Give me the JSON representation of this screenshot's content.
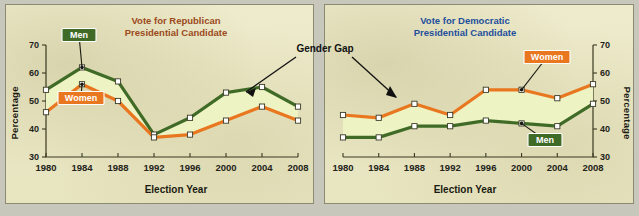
{
  "figure": {
    "background_color": "#c8c7bb",
    "panel_background": "#ece9c8",
    "annotation": {
      "label": "Gender Gap",
      "name": "gender-gap-annotation"
    }
  },
  "colors": {
    "men_line": "#3f6b27",
    "women_line": "#e8771f",
    "band_fill": "#eef3c3",
    "republican_title": "#9c4a1c",
    "democratic_title": "#1d4f9c",
    "marker_fill": "#ffffff"
  },
  "legend": {
    "men_label": "Men",
    "women_label": "Women"
  },
  "chart_data": [
    {
      "id": "republican",
      "type": "line",
      "title": "Vote for Republican\nPresidential Candidate",
      "title_line1": "Vote for Republican",
      "title_line2": "Presidential Candidate",
      "title_color": "#9c4a1c",
      "xlabel": "Election Year",
      "ylabel": "Percentage",
      "ylabel_side": "left",
      "categories": [
        "1980",
        "1984",
        "1988",
        "1992",
        "1996",
        "2000",
        "2004",
        "2008"
      ],
      "x": [
        1980,
        1984,
        1988,
        1992,
        1996,
        2000,
        2004,
        2008
      ],
      "ylim": [
        30,
        70
      ],
      "yticks": [
        30,
        40,
        50,
        60,
        70
      ],
      "grid": false,
      "legend_position": "inside-upper-left",
      "series": [
        {
          "name": "Men",
          "color": "#3f6b27",
          "values": [
            54,
            62,
            57,
            38,
            44,
            53,
            55,
            48
          ]
        },
        {
          "name": "Women",
          "color": "#e8771f",
          "values": [
            46,
            56,
            50,
            37,
            38,
            43,
            48,
            43
          ]
        }
      ]
    },
    {
      "id": "democratic",
      "type": "line",
      "title": "Vote for Democratic\nPresidential Candidate",
      "title_line1": "Vote for Democratic",
      "title_line2": "Presidential Candidate",
      "title_color": "#1d4f9c",
      "xlabel": "Election Year",
      "ylabel": "Percentage",
      "ylabel_side": "right",
      "categories": [
        "1980",
        "1984",
        "1988",
        "1992",
        "1996",
        "2000",
        "2004",
        "2008"
      ],
      "x": [
        1980,
        1984,
        1988,
        1992,
        1996,
        2000,
        2004,
        2008
      ],
      "ylim": [
        30,
        70
      ],
      "yticks": [
        30,
        40,
        50,
        60,
        70
      ],
      "grid": false,
      "legend_position": "inside-right",
      "series": [
        {
          "name": "Women",
          "color": "#e8771f",
          "values": [
            45,
            44,
            49,
            45,
            54,
            54,
            51,
            56
          ]
        },
        {
          "name": "Men",
          "color": "#3f6b27",
          "values": [
            37,
            37,
            41,
            41,
            43,
            42,
            41,
            49
          ]
        }
      ]
    }
  ]
}
